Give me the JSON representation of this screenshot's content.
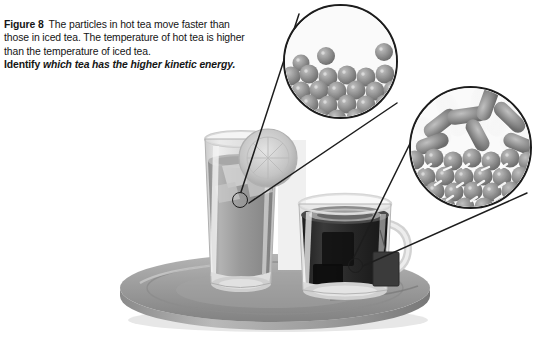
{
  "figure": {
    "label": "Figure 8",
    "body": "The particles in hot tea move faster than those in iced tea. The temperature of hot tea is higher than the temperature of iced tea.",
    "prompt_label": "Identify",
    "prompt_text": "which tea has the higher kinetic energy."
  },
  "colors": {
    "background": "#ffffff",
    "outline": "#1c1c1c",
    "particle_fill": "#8f8f8f",
    "particle_shade": "#6f6f6f",
    "particle_highlight": "#cfcfcf",
    "blur_streak": "#e9e9e9",
    "tray_top": "#9a9a9a",
    "tray_edge": "#6d6d6d",
    "iced_tea_liquid": "#9b9b9b",
    "hot_tea_liquid": "#2a2a2a",
    "glass_rim": "#d8d8d8",
    "lemon": "#c8c8c8",
    "tea_bag_tag": "#3a3a3a"
  },
  "insets": [
    {
      "id": "iced-tea-particles",
      "name": "iced-tea-particle-inset",
      "depicts": "closely packed slow-moving particles of iced tea",
      "motion": "slow",
      "center_x": 340,
      "center_y": 61,
      "diameter": 115,
      "packed_rows": 5,
      "free_particles": 3,
      "streaks": 0
    },
    {
      "id": "hot-tea-particles",
      "name": "hot-tea-particle-inset",
      "depicts": "fast-moving particles of hot tea shown with motion blur streaks",
      "motion": "fast",
      "center_x": 470,
      "center_y": 147,
      "diameter": 123,
      "packed_rows": 4,
      "free_particles": 7,
      "streaks": 9
    }
  ],
  "objects": {
    "tray": {
      "name": "serving-tray",
      "shape": "round flat metal tray",
      "center_x": 275,
      "center_y": 288,
      "width": 310,
      "height": 68
    },
    "iced_tea_glass": {
      "name": "iced-tea-glass",
      "contents": "iced tea",
      "garnish": "lemon slice",
      "has_ice": true,
      "left": 203,
      "top": 135,
      "width": 76,
      "height": 152
    },
    "hot_tea_mug": {
      "name": "hot-tea-mug",
      "contents": "hot tea",
      "has_handle": true,
      "has_tea_bag": true,
      "left": 297,
      "top": 198,
      "width": 98,
      "height": 96
    }
  },
  "leader_lines": [
    {
      "name": "leader-line-cold-upper",
      "from_x": 241,
      "from_y": 193,
      "to_x": 300,
      "to_y": 16
    },
    {
      "name": "leader-line-cold-lower",
      "from_x": 248,
      "from_y": 203,
      "to_x": 396,
      "to_y": 104
    },
    {
      "name": "leader-line-hot-upper",
      "from_x": 354,
      "from_y": 257,
      "to_x": 430,
      "to_y": 104
    },
    {
      "name": "leader-line-hot-lower",
      "from_x": 362,
      "from_y": 265,
      "to_x": 523,
      "to_y": 189
    }
  ]
}
